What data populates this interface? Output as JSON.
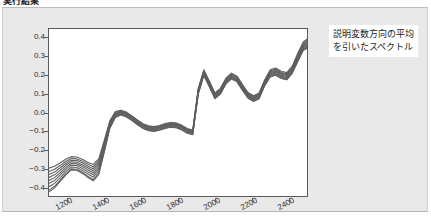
{
  "document": {
    "heading": "実行結果"
  },
  "annotation": {
    "line1": "説明変数方向の平均",
    "line2": "を引いたスペクトル"
  },
  "colors": {
    "panel_background": "#e9e9e9",
    "plot_background": "#ffffff",
    "axis": "#5a5a5a",
    "curve": "#5f5f5f",
    "tick_text": "#2e2e2e"
  },
  "chart_data": {
    "type": "line",
    "title": "",
    "xlabel": "",
    "ylabel": "",
    "xlim": [
      1100,
      2500
    ],
    "ylim": [
      -0.45,
      0.45
    ],
    "grid": false,
    "legend_position": "right-outside",
    "xticks": [
      1200,
      1400,
      1600,
      1800,
      2000,
      2200,
      2400
    ],
    "yticks": [
      -0.4,
      -0.3,
      -0.2,
      -0.1,
      0.0,
      0.1,
      0.2,
      0.3,
      0.4
    ],
    "x": [
      1100,
      1130,
      1160,
      1190,
      1220,
      1250,
      1280,
      1310,
      1340,
      1370,
      1400,
      1430,
      1460,
      1490,
      1520,
      1550,
      1580,
      1610,
      1640,
      1670,
      1700,
      1730,
      1760,
      1790,
      1820,
      1850,
      1880,
      1910,
      1940,
      1970,
      2000,
      2030,
      2060,
      2090,
      2120,
      2150,
      2180,
      2210,
      2240,
      2270,
      2300,
      2330,
      2360,
      2390,
      2420,
      2450,
      2480,
      2500
    ],
    "series": [
      {
        "name": "spectrum-1",
        "values": [
          -0.3,
          -0.29,
          -0.272,
          -0.252,
          -0.238,
          -0.24,
          -0.252,
          -0.268,
          -0.28,
          -0.25,
          -0.15,
          -0.045,
          0.005,
          0.012,
          0.002,
          -0.018,
          -0.04,
          -0.06,
          -0.072,
          -0.076,
          -0.07,
          -0.06,
          -0.054,
          -0.056,
          -0.068,
          -0.086,
          -0.094,
          0.13,
          0.23,
          0.17,
          0.105,
          0.13,
          0.185,
          0.212,
          0.196,
          0.15,
          0.108,
          0.09,
          0.105,
          0.175,
          0.23,
          0.24,
          0.222,
          0.215,
          0.25,
          0.32,
          0.38,
          0.395
        ]
      },
      {
        "name": "spectrum-2",
        "values": [
          -0.318,
          -0.306,
          -0.286,
          -0.264,
          -0.248,
          -0.25,
          -0.262,
          -0.278,
          -0.292,
          -0.26,
          -0.158,
          -0.05,
          0.001,
          0.009,
          -0.001,
          -0.021,
          -0.043,
          -0.063,
          -0.075,
          -0.079,
          -0.073,
          -0.063,
          -0.057,
          -0.059,
          -0.071,
          -0.089,
          -0.097,
          0.126,
          0.226,
          0.166,
          0.101,
          0.126,
          0.181,
          0.208,
          0.192,
          0.146,
          0.104,
          0.086,
          0.101,
          0.17,
          0.224,
          0.234,
          0.216,
          0.209,
          0.244,
          0.314,
          0.374,
          0.389
        ]
      },
      {
        "name": "spectrum-3",
        "values": [
          -0.334,
          -0.321,
          -0.299,
          -0.275,
          -0.257,
          -0.259,
          -0.271,
          -0.288,
          -0.303,
          -0.27,
          -0.166,
          -0.055,
          -0.003,
          0.006,
          -0.004,
          -0.024,
          -0.046,
          -0.066,
          -0.078,
          -0.082,
          -0.076,
          -0.066,
          -0.06,
          -0.062,
          -0.074,
          -0.092,
          -0.1,
          0.122,
          0.222,
          0.162,
          0.097,
          0.122,
          0.177,
          0.204,
          0.188,
          0.142,
          0.1,
          0.082,
          0.097,
          0.166,
          0.219,
          0.229,
          0.211,
          0.204,
          0.239,
          0.308,
          0.368,
          0.382
        ]
      },
      {
        "name": "spectrum-4",
        "values": [
          -0.35,
          -0.336,
          -0.312,
          -0.286,
          -0.266,
          -0.268,
          -0.281,
          -0.298,
          -0.314,
          -0.28,
          -0.174,
          -0.06,
          -0.007,
          0.003,
          -0.007,
          -0.027,
          -0.049,
          -0.069,
          -0.081,
          -0.085,
          -0.079,
          -0.069,
          -0.063,
          -0.065,
          -0.077,
          -0.095,
          -0.103,
          0.118,
          0.218,
          0.158,
          0.093,
          0.118,
          0.173,
          0.2,
          0.184,
          0.138,
          0.096,
          0.078,
          0.093,
          0.162,
          0.214,
          0.224,
          0.206,
          0.199,
          0.234,
          0.302,
          0.362,
          0.376
        ]
      },
      {
        "name": "spectrum-5",
        "values": [
          -0.366,
          -0.351,
          -0.325,
          -0.297,
          -0.275,
          -0.277,
          -0.29,
          -0.308,
          -0.325,
          -0.291,
          -0.182,
          -0.065,
          -0.011,
          0.0,
          -0.01,
          -0.03,
          -0.052,
          -0.072,
          -0.084,
          -0.088,
          -0.082,
          -0.072,
          -0.066,
          -0.068,
          -0.08,
          -0.098,
          -0.106,
          0.114,
          0.214,
          0.154,
          0.089,
          0.114,
          0.169,
          0.196,
          0.18,
          0.134,
          0.092,
          0.074,
          0.089,
          0.158,
          0.209,
          0.219,
          0.201,
          0.194,
          0.229,
          0.296,
          0.356,
          0.37
        ]
      },
      {
        "name": "spectrum-6",
        "values": [
          -0.382,
          -0.366,
          -0.338,
          -0.308,
          -0.284,
          -0.286,
          -0.3,
          -0.319,
          -0.336,
          -0.302,
          -0.19,
          -0.07,
          -0.015,
          -0.003,
          -0.013,
          -0.033,
          -0.055,
          -0.075,
          -0.087,
          -0.091,
          -0.085,
          -0.075,
          -0.069,
          -0.071,
          -0.083,
          -0.101,
          -0.109,
          0.11,
          0.21,
          0.15,
          0.085,
          0.11,
          0.165,
          0.192,
          0.176,
          0.13,
          0.088,
          0.07,
          0.085,
          0.154,
          0.204,
          0.214,
          0.196,
          0.189,
          0.224,
          0.29,
          0.35,
          0.364
        ]
      },
      {
        "name": "spectrum-7",
        "values": [
          -0.4,
          -0.382,
          -0.352,
          -0.32,
          -0.294,
          -0.296,
          -0.311,
          -0.331,
          -0.348,
          -0.314,
          -0.199,
          -0.076,
          -0.019,
          -0.007,
          -0.017,
          -0.037,
          -0.059,
          -0.079,
          -0.091,
          -0.095,
          -0.089,
          -0.079,
          -0.073,
          -0.075,
          -0.087,
          -0.105,
          -0.113,
          0.106,
          0.206,
          0.146,
          0.081,
          0.106,
          0.161,
          0.188,
          0.172,
          0.126,
          0.084,
          0.066,
          0.081,
          0.15,
          0.199,
          0.209,
          0.191,
          0.184,
          0.219,
          0.284,
          0.344,
          0.357
        ]
      },
      {
        "name": "spectrum-8",
        "values": [
          -0.418,
          -0.398,
          -0.366,
          -0.332,
          -0.304,
          -0.306,
          -0.322,
          -0.343,
          -0.361,
          -0.327,
          -0.208,
          -0.082,
          -0.024,
          -0.011,
          -0.021,
          -0.041,
          -0.063,
          -0.083,
          -0.095,
          -0.099,
          -0.093,
          -0.083,
          -0.077,
          -0.079,
          -0.091,
          -0.109,
          -0.117,
          0.102,
          0.202,
          0.142,
          0.077,
          0.102,
          0.157,
          0.184,
          0.168,
          0.122,
          0.08,
          0.062,
          0.077,
          0.146,
          0.194,
          0.204,
          0.186,
          0.179,
          0.214,
          0.278,
          0.338,
          0.35
        ]
      },
      {
        "name": "spectrum-9",
        "values": [
          -0.428,
          -0.406,
          -0.372,
          -0.337,
          -0.309,
          -0.311,
          -0.327,
          -0.349,
          -0.368,
          -0.334,
          -0.213,
          -0.086,
          -0.027,
          -0.014,
          -0.024,
          -0.044,
          -0.066,
          -0.086,
          -0.098,
          -0.102,
          -0.096,
          -0.086,
          -0.08,
          -0.082,
          -0.094,
          -0.112,
          -0.12,
          0.099,
          0.199,
          0.139,
          0.074,
          0.099,
          0.154,
          0.181,
          0.165,
          0.119,
          0.077,
          0.059,
          0.074,
          0.143,
          0.191,
          0.201,
          0.183,
          0.176,
          0.211,
          0.275,
          0.335,
          0.346
        ]
      }
    ]
  }
}
